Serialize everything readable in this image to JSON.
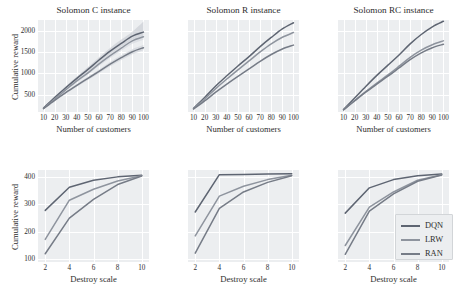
{
  "figure": {
    "width": 460,
    "height": 308,
    "background": "#ffffff",
    "panel_background": "#eceef0",
    "grid_color": "#ffffff"
  },
  "series_style": {
    "DQN": {
      "color": "#5e6572",
      "band": "#c9ccd3"
    },
    "LRW": {
      "color": "#8e949e",
      "band": "#d6d9de"
    },
    "RAN": {
      "color": "#767c87",
      "band": "#d0d3d9"
    }
  },
  "legend": {
    "position": "bottom-right-panel",
    "entries": [
      {
        "label": "DQN",
        "color": "#5e6572"
      },
      {
        "label": "LRW",
        "color": "#8e949e"
      },
      {
        "label": "RAN",
        "color": "#767c87"
      }
    ]
  },
  "chart_data": [
    {
      "id": "top-left",
      "type": "line",
      "title": "Solomon C instance",
      "xlabel": "Number of customers",
      "ylabel": "Cumulative reward",
      "x": [
        10,
        20,
        30,
        40,
        50,
        60,
        70,
        80,
        90,
        100
      ],
      "xticks": [
        10,
        20,
        30,
        40,
        50,
        60,
        70,
        80,
        90,
        100
      ],
      "yticks": [
        500,
        1000,
        1500,
        2000
      ],
      "xlim": [
        5,
        105
      ],
      "ylim": [
        90,
        2250
      ],
      "grid": true,
      "band": true,
      "series": [
        {
          "name": "DQN",
          "values": [
            185,
            430,
            660,
            880,
            1090,
            1310,
            1520,
            1700,
            1870,
            1965
          ],
          "band_low": [
            175,
            405,
            625,
            840,
            1040,
            1255,
            1455,
            1630,
            1795,
            1880
          ],
          "band_high": [
            195,
            455,
            695,
            925,
            1145,
            1375,
            1595,
            1790,
            1975,
            2215
          ]
        },
        {
          "name": "LRW",
          "values": [
            175,
            395,
            610,
            820,
            1010,
            1220,
            1415,
            1590,
            1760,
            1855
          ],
          "band_low": [
            166,
            375,
            582,
            785,
            968,
            1170,
            1358,
            1528,
            1692,
            1785
          ],
          "band_high": [
            184,
            415,
            640,
            858,
            1055,
            1272,
            1475,
            1655,
            1830,
            1928
          ]
        },
        {
          "name": "RAN",
          "values": [
            170,
            365,
            545,
            715,
            880,
            1045,
            1215,
            1365,
            1505,
            1600
          ],
          "band_low": [
            162,
            348,
            520,
            684,
            843,
            1002,
            1166,
            1311,
            1447,
            1540
          ],
          "band_high": [
            178,
            383,
            572,
            748,
            918,
            1090,
            1266,
            1421,
            1565,
            1662
          ]
        }
      ]
    },
    {
      "id": "top-middle",
      "type": "line",
      "title": "Solomon R instance",
      "xlabel": "Number of customers",
      "ylabel": "",
      "x": [
        10,
        20,
        30,
        40,
        50,
        60,
        70,
        80,
        90,
        100
      ],
      "xticks": [
        10,
        20,
        30,
        40,
        50,
        60,
        70,
        80,
        90,
        100
      ],
      "yticks": [],
      "xlim": [
        5,
        105
      ],
      "ylim": [
        90,
        2250
      ],
      "grid": true,
      "band": false,
      "series": [
        {
          "name": "DQN",
          "values": [
            180,
            430,
            700,
            940,
            1170,
            1390,
            1625,
            1840,
            2040,
            2185
          ]
        },
        {
          "name": "LRW",
          "values": [
            170,
            395,
            640,
            865,
            1080,
            1290,
            1500,
            1690,
            1845,
            1955
          ]
        },
        {
          "name": "RAN",
          "values": [
            160,
            350,
            555,
            745,
            925,
            1100,
            1280,
            1440,
            1570,
            1660
          ]
        }
      ]
    },
    {
      "id": "top-right",
      "type": "line",
      "title": "Solomon RC instance",
      "xlabel": "Number of customers",
      "ylabel": "",
      "x": [
        10,
        20,
        30,
        40,
        50,
        60,
        70,
        80,
        90,
        100
      ],
      "xticks": [
        10,
        20,
        30,
        40,
        50,
        60,
        70,
        80,
        90,
        100
      ],
      "yticks": [],
      "xlim": [
        5,
        105
      ],
      "ylim": [
        90,
        2250
      ],
      "grid": true,
      "band": false,
      "series": [
        {
          "name": "DQN",
          "values": [
            150,
            420,
            690,
            950,
            1190,
            1430,
            1690,
            1910,
            2090,
            2220
          ]
        },
        {
          "name": "LRW",
          "values": [
            142,
            360,
            570,
            770,
            960,
            1165,
            1375,
            1545,
            1670,
            1760
          ]
        },
        {
          "name": "RAN",
          "values": [
            140,
            350,
            555,
            745,
            930,
            1125,
            1320,
            1480,
            1600,
            1680
          ]
        }
      ]
    },
    {
      "id": "bottom-left",
      "type": "line",
      "title": "",
      "xlabel": "Destroy scale",
      "ylabel": "Cumulative reward",
      "x": [
        2,
        4,
        6,
        8,
        10
      ],
      "xticks": [
        2,
        4,
        6,
        8,
        10
      ],
      "yticks": [
        100,
        200,
        300,
        400
      ],
      "xlim": [
        1.4,
        10.6
      ],
      "ylim": [
        90,
        425
      ],
      "grid": true,
      "band": false,
      "series": [
        {
          "name": "DQN",
          "values": [
            278,
            362,
            388,
            400,
            406
          ]
        },
        {
          "name": "LRW",
          "values": [
            172,
            315,
            355,
            385,
            404
          ]
        },
        {
          "name": "RAN",
          "values": [
            120,
            250,
            318,
            372,
            403
          ]
        }
      ]
    },
    {
      "id": "bottom-middle",
      "type": "line",
      "title": "",
      "xlabel": "Destroy scale",
      "ylabel": "",
      "x": [
        2,
        4,
        6,
        8,
        10
      ],
      "xticks": [
        2,
        4,
        6,
        8,
        10
      ],
      "yticks": [],
      "xlim": [
        1.4,
        10.6
      ],
      "ylim": [
        90,
        425
      ],
      "grid": true,
      "band": false,
      "series": [
        {
          "name": "DQN",
          "values": [
            272,
            408,
            409,
            410,
            411
          ]
        },
        {
          "name": "LRW",
          "values": [
            185,
            330,
            366,
            390,
            406
          ]
        },
        {
          "name": "RAN",
          "values": [
            122,
            285,
            345,
            380,
            404
          ]
        }
      ]
    },
    {
      "id": "bottom-right",
      "type": "line",
      "title": "",
      "xlabel": "Destroy scale",
      "ylabel": "",
      "x": [
        2,
        4,
        6,
        8,
        10
      ],
      "xticks": [
        2,
        4,
        6,
        8,
        10
      ],
      "yticks": [],
      "xlim": [
        1.4,
        10.6
      ],
      "ylim": [
        90,
        425
      ],
      "grid": true,
      "band": false,
      "series": [
        {
          "name": "DQN",
          "values": [
            268,
            360,
            390,
            404,
            410
          ]
        },
        {
          "name": "LRW",
          "values": [
            150,
            290,
            345,
            388,
            408
          ]
        },
        {
          "name": "RAN",
          "values": [
            118,
            275,
            338,
            384,
            407
          ]
        }
      ]
    }
  ]
}
